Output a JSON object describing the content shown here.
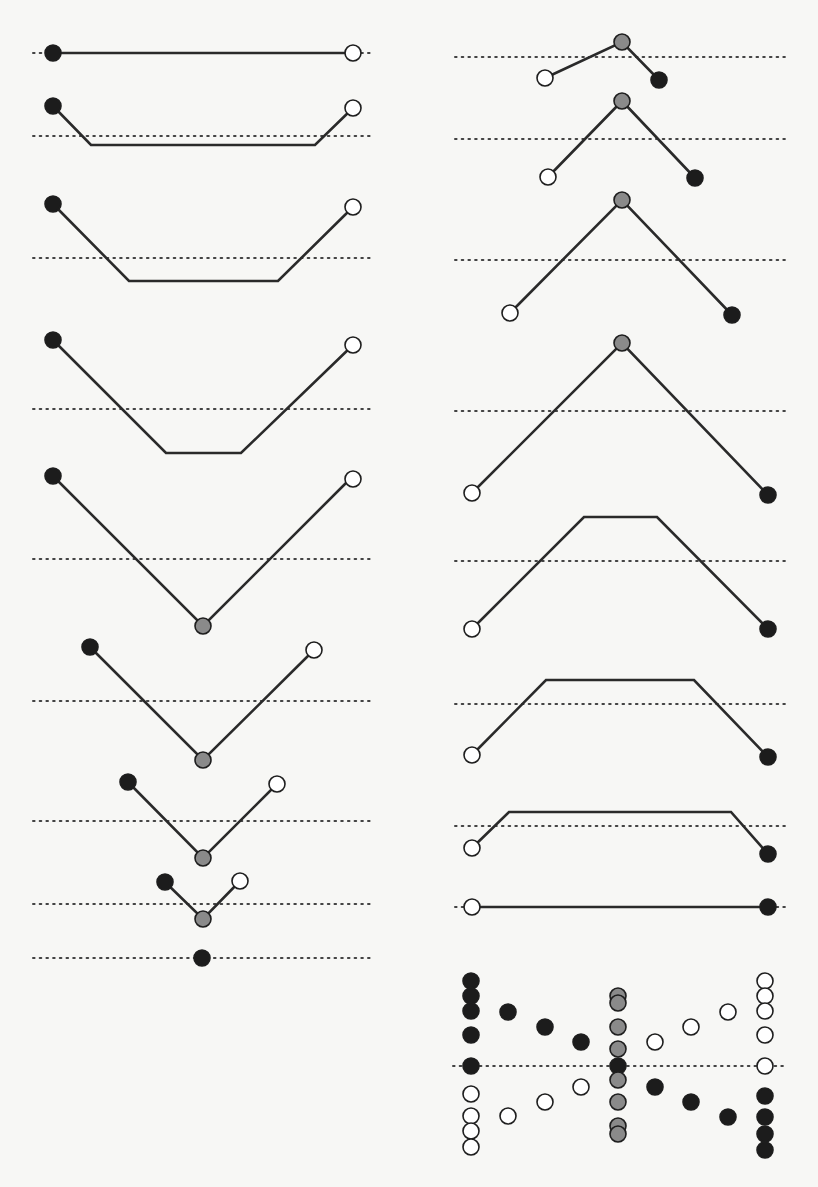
{
  "figure": {
    "colors": {
      "line": "#2a2a2a",
      "dotted_line": "#444444",
      "filled_node": "#1c1c1c",
      "grey_node": "#8a8a8a",
      "open_node_fill": "#ffffff",
      "background": "#f7f7f5"
    },
    "legend": {
      "filled": "filled-end-node",
      "open": "open-end-node",
      "grey": "junction-node"
    }
  },
  "left_column": {
    "panels": [
      {
        "id": "L1",
        "dotted_y": 53,
        "path": [
          [
            53,
            53
          ],
          [
            353,
            53
          ]
        ],
        "nodes": [
          {
            "x": 53,
            "y": 53,
            "type": "filled"
          },
          {
            "x": 353,
            "y": 53,
            "type": "open"
          }
        ]
      },
      {
        "id": "L2",
        "dotted_y": 136,
        "path": [
          [
            53,
            106
          ],
          [
            91,
            145
          ],
          [
            315,
            145
          ],
          [
            353,
            108
          ]
        ],
        "nodes": [
          {
            "x": 53,
            "y": 106,
            "type": "filled"
          },
          {
            "x": 353,
            "y": 108,
            "type": "open"
          }
        ]
      },
      {
        "id": "L3",
        "dotted_y": 258,
        "path": [
          [
            53,
            204
          ],
          [
            129,
            281
          ],
          [
            278,
            281
          ],
          [
            353,
            207
          ]
        ],
        "nodes": [
          {
            "x": 53,
            "y": 204,
            "type": "filled"
          },
          {
            "x": 353,
            "y": 207,
            "type": "open"
          }
        ]
      },
      {
        "id": "L4",
        "dotted_y": 409,
        "path": [
          [
            53,
            340
          ],
          [
            166,
            453
          ],
          [
            241,
            453
          ],
          [
            353,
            345
          ]
        ],
        "nodes": [
          {
            "x": 53,
            "y": 340,
            "type": "filled"
          },
          {
            "x": 353,
            "y": 345,
            "type": "open"
          }
        ]
      },
      {
        "id": "L5",
        "dotted_y": 559,
        "path": [
          [
            53,
            476
          ],
          [
            203,
            626
          ],
          [
            353,
            476
          ]
        ],
        "nodes": [
          {
            "x": 53,
            "y": 476,
            "type": "filled"
          },
          {
            "x": 353,
            "y": 479,
            "type": "open"
          },
          {
            "x": 203,
            "y": 626,
            "type": "grey"
          }
        ]
      },
      {
        "id": "L6",
        "dotted_y": 701,
        "path": [
          [
            90,
            647
          ],
          [
            203,
            760
          ],
          [
            314,
            650
          ]
        ],
        "nodes": [
          {
            "x": 90,
            "y": 647,
            "type": "filled"
          },
          {
            "x": 314,
            "y": 650,
            "type": "open"
          },
          {
            "x": 203,
            "y": 760,
            "type": "grey"
          }
        ]
      },
      {
        "id": "L7",
        "dotted_y": 821,
        "path": [
          [
            128,
            782
          ],
          [
            203,
            858
          ],
          [
            277,
            784
          ]
        ],
        "nodes": [
          {
            "x": 128,
            "y": 782,
            "type": "filled"
          },
          {
            "x": 277,
            "y": 784,
            "type": "open"
          },
          {
            "x": 203,
            "y": 858,
            "type": "grey"
          }
        ]
      },
      {
        "id": "L8",
        "dotted_y": 904,
        "path": [
          [
            165,
            882
          ],
          [
            203,
            919
          ],
          [
            240,
            881
          ]
        ],
        "nodes": [
          {
            "x": 165,
            "y": 882,
            "type": "filled"
          },
          {
            "x": 240,
            "y": 881,
            "type": "open"
          },
          {
            "x": 203,
            "y": 919,
            "type": "grey"
          }
        ]
      },
      {
        "id": "L9",
        "dotted_y": 958,
        "path": [],
        "nodes": [
          {
            "x": 202,
            "y": 958,
            "type": "filled"
          }
        ]
      }
    ]
  },
  "right_column": {
    "panels": [
      {
        "id": "R1",
        "dotted_y": 57,
        "path": [
          [
            478,
            78
          ],
          [
            622,
            42
          ],
          [
            659,
            80
          ]
        ],
        "nodes": [
          {
            "x": 622,
            "y": 42,
            "type": "grey"
          },
          {
            "x": 545,
            "y": 78,
            "type": "open"
          },
          {
            "x": 659,
            "y": 80,
            "type": "filled"
          }
        ]
      },
      {
        "id": "R2",
        "dotted_y": 139,
        "path": [
          [
            548,
            177
          ],
          [
            622,
            101
          ],
          [
            695,
            178
          ]
        ],
        "nodes": [
          {
            "x": 622,
            "y": 101,
            "type": "grey"
          },
          {
            "x": 548,
            "y": 177,
            "type": "open"
          },
          {
            "x": 695,
            "y": 178,
            "type": "filled"
          }
        ]
      },
      {
        "id": "R3",
        "dotted_y": 260,
        "path": [
          [
            510,
            313
          ],
          [
            622,
            200
          ],
          [
            732,
            315
          ]
        ],
        "nodes": [
          {
            "x": 622,
            "y": 200,
            "type": "grey"
          },
          {
            "x": 510,
            "y": 313,
            "type": "open"
          },
          {
            "x": 732,
            "y": 315,
            "type": "filled"
          }
        ]
      },
      {
        "id": "R4",
        "dotted_y": 411,
        "path": [
          [
            472,
            493
          ],
          [
            622,
            343
          ],
          [
            768,
            495
          ]
        ],
        "nodes": [
          {
            "x": 622,
            "y": 343,
            "type": "grey"
          },
          {
            "x": 472,
            "y": 493,
            "type": "open"
          },
          {
            "x": 768,
            "y": 495,
            "type": "filled"
          }
        ]
      },
      {
        "id": "R5",
        "dotted_y": 561,
        "path": [
          [
            472,
            629
          ],
          [
            584,
            517
          ],
          [
            657,
            517
          ],
          [
            768,
            629
          ]
        ],
        "nodes": [
          {
            "x": 472,
            "y": 629,
            "type": "open"
          },
          {
            "x": 768,
            "y": 629,
            "type": "filled"
          }
        ]
      },
      {
        "id": "R6",
        "dotted_y": 704,
        "path": [
          [
            472,
            755
          ],
          [
            546,
            680
          ],
          [
            694,
            680
          ],
          [
            768,
            757
          ]
        ],
        "nodes": [
          {
            "x": 472,
            "y": 755,
            "type": "open"
          },
          {
            "x": 768,
            "y": 757,
            "type": "filled"
          }
        ]
      },
      {
        "id": "R7",
        "dotted_y": 824,
        "path": [
          [
            472,
            814
          ],
          [
            509,
            783
          ],
          [
            731,
            783
          ],
          [
            768,
            854
          ]
        ],
        "nodes": [
          {
            "x": 472,
            "y": 848,
            "type": "open"
          },
          {
            "x": 768,
            "y": 854,
            "type": "filled"
          }
        ]
      },
      {
        "id": "R8",
        "dotted_y": 907,
        "path": [
          [
            472,
            907
          ],
          [
            768,
            907
          ]
        ],
        "nodes": [
          {
            "x": 472,
            "y": 907,
            "type": "open"
          },
          {
            "x": 768,
            "y": 907,
            "type": "filled"
          }
        ]
      }
    ]
  },
  "scatter": {
    "dotted_y": 1066,
    "dotted_x": [
      453,
      787
    ],
    "points": [
      {
        "x": 471,
        "y": 981,
        "type": "filled"
      },
      {
        "x": 471,
        "y": 996,
        "type": "filled"
      },
      {
        "x": 471,
        "y": 1011,
        "type": "filled"
      },
      {
        "x": 471,
        "y": 1035,
        "type": "filled"
      },
      {
        "x": 471,
        "y": 1066,
        "type": "filled"
      },
      {
        "x": 471,
        "y": 1094,
        "type": "open"
      },
      {
        "x": 471,
        "y": 1116,
        "type": "open"
      },
      {
        "x": 471,
        "y": 1131,
        "type": "open"
      },
      {
        "x": 471,
        "y": 1147,
        "type": "open"
      },
      {
        "x": 508,
        "y": 1012,
        "type": "filled"
      },
      {
        "x": 545,
        "y": 1027,
        "type": "filled"
      },
      {
        "x": 581,
        "y": 1042,
        "type": "filled"
      },
      {
        "x": 508,
        "y": 1116,
        "type": "open"
      },
      {
        "x": 545,
        "y": 1102,
        "type": "open"
      },
      {
        "x": 581,
        "y": 1087,
        "type": "open"
      },
      {
        "x": 618,
        "y": 996,
        "type": "grey"
      },
      {
        "x": 618,
        "y": 1003,
        "type": "grey"
      },
      {
        "x": 618,
        "y": 1027,
        "type": "grey"
      },
      {
        "x": 618,
        "y": 1049,
        "type": "grey"
      },
      {
        "x": 618,
        "y": 1066,
        "type": "filled"
      },
      {
        "x": 618,
        "y": 1080,
        "type": "grey"
      },
      {
        "x": 618,
        "y": 1102,
        "type": "grey"
      },
      {
        "x": 618,
        "y": 1126,
        "type": "grey"
      },
      {
        "x": 618,
        "y": 1134,
        "type": "grey"
      },
      {
        "x": 655,
        "y": 1042,
        "type": "open"
      },
      {
        "x": 691,
        "y": 1027,
        "type": "open"
      },
      {
        "x": 728,
        "y": 1012,
        "type": "open"
      },
      {
        "x": 655,
        "y": 1087,
        "type": "filled"
      },
      {
        "x": 691,
        "y": 1102,
        "type": "filled"
      },
      {
        "x": 728,
        "y": 1117,
        "type": "filled"
      },
      {
        "x": 765,
        "y": 981,
        "type": "open"
      },
      {
        "x": 765,
        "y": 996,
        "type": "open"
      },
      {
        "x": 765,
        "y": 1011,
        "type": "open"
      },
      {
        "x": 765,
        "y": 1035,
        "type": "open"
      },
      {
        "x": 765,
        "y": 1066,
        "type": "open"
      },
      {
        "x": 765,
        "y": 1096,
        "type": "filled"
      },
      {
        "x": 765,
        "y": 1117,
        "type": "filled"
      },
      {
        "x": 765,
        "y": 1134,
        "type": "filled"
      },
      {
        "x": 765,
        "y": 1150,
        "type": "filled"
      }
    ]
  },
  "layout": {
    "left_dotted_x": [
      33,
      372
    ],
    "right_dotted_x": [
      455,
      788
    ],
    "node_radius": 8,
    "scatter_radius": 8
  }
}
